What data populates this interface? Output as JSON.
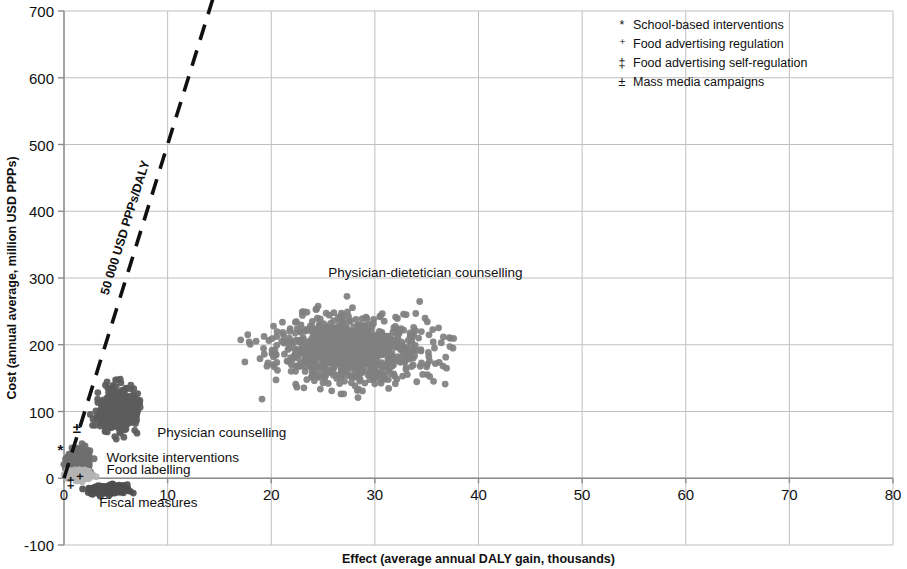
{
  "chart_data": {
    "type": "scatter",
    "title": "",
    "xlabel": "Effect (average annual DALY gain, thousands)",
    "ylabel": "Cost (annual average, million USD PPPs)",
    "xlim": [
      0,
      80
    ],
    "ylim": [
      -100,
      700
    ],
    "xticks": [
      "0",
      "10",
      "20",
      "30",
      "40",
      "50",
      "60",
      "70",
      "80"
    ],
    "yticks": [
      "-100",
      "0",
      "100",
      "200",
      "300",
      "400",
      "500",
      "600",
      "700"
    ],
    "grid": true,
    "legend_position": "top-right",
    "threshold_line": {
      "label": "50 000 USD PPPs/DALY",
      "style": "dashed",
      "x0": 0,
      "y0": 0,
      "x1": 14.5,
      "y1": 725
    },
    "clusters": [
      {
        "name": "Physician-dietetician counselling",
        "label": "Physician-dietetician counselling",
        "color": "#808080",
        "center_x": 27.5,
        "center_y": 192,
        "spread_x": 6.2,
        "spread_y": 42,
        "n": 900,
        "label_x": 25.5,
        "label_y": 302
      },
      {
        "name": "Physician counselling",
        "label": "Physician counselling",
        "color": "#5d5d5d",
        "center_x": 5.2,
        "center_y": 103,
        "spread_x": 1.7,
        "spread_y": 28,
        "n": 380,
        "label_x": 9.0,
        "label_y": 62
      },
      {
        "name": "Worksite interventions",
        "label": "Worksite interventions",
        "color": "#6e6e6e",
        "center_x": 1.5,
        "center_y": 28,
        "spread_x": 0.9,
        "spread_y": 15,
        "n": 220,
        "label_x": 4.1,
        "label_y": 24
      },
      {
        "name": "Food labelling",
        "label": "Food labelling",
        "color": "#b4b4b4",
        "center_x": 1.5,
        "center_y": 5,
        "spread_x": 1.0,
        "spread_y": 6,
        "n": 200,
        "label_x": 4.1,
        "label_y": 6
      },
      {
        "name": "Fiscal measures",
        "label": "Fiscal measures",
        "color": "#4f4f4f",
        "center_x": 4.4,
        "center_y": -17,
        "spread_x": 1.5,
        "spread_y": 6,
        "n": 200,
        "label_x": 3.4,
        "label_y": -43
      }
    ],
    "point_markers": [
      {
        "glyph": "*",
        "name": "School-based interventions",
        "x": -0.35,
        "y": 35
      },
      {
        "glyph": "±",
        "name": "Mass media campaigns",
        "x": 1.25,
        "y": 68
      },
      {
        "glyph": "‡",
        "name": "Food advertising self-regulation",
        "x": 0.65,
        "y": -14
      },
      {
        "glyph": "⁺",
        "name": "Food advertising regulation",
        "x": 1.5,
        "y": -8
      }
    ],
    "legend": [
      {
        "glyph": "*",
        "label": "School-based interventions"
      },
      {
        "glyph": "⁺",
        "label": "Food advertising regulation"
      },
      {
        "glyph": "‡",
        "label": "Food advertising self-regulation"
      },
      {
        "glyph": "±",
        "label": "Mass media campaigns"
      }
    ],
    "colors": {
      "grid": "#bfbfbf",
      "axis": "#8c8c8c",
      "text": "#111111",
      "threshold": "#111111"
    }
  }
}
